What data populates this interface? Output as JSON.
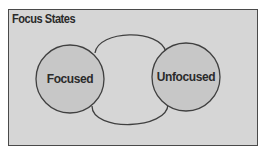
{
  "diagram": {
    "title": "Focus States",
    "colors": {
      "frame_background": "#d6d6d6",
      "frame_border": "#4a4a4a",
      "node_fill": "#c7c7c7",
      "stroke": "#404040",
      "text": "#2b2b2b"
    },
    "nodes": [
      {
        "id": "focused",
        "label": "Focused"
      },
      {
        "id": "unfocused",
        "label": "Unfocused"
      }
    ],
    "edges": [
      {
        "from": "focused",
        "to": "unfocused",
        "path": "top-arc"
      },
      {
        "from": "unfocused",
        "to": "focused",
        "path": "bottom-arc"
      }
    ]
  }
}
